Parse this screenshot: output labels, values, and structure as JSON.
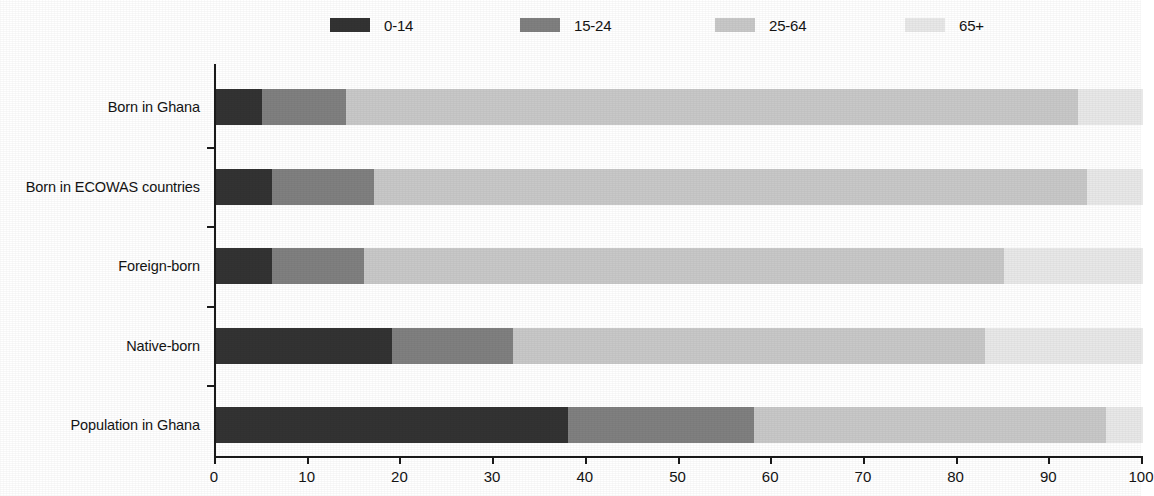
{
  "chart_data": {
    "type": "bar",
    "orientation": "horizontal",
    "stacked": true,
    "normalized_percent": true,
    "title": "",
    "subtitle": "",
    "xlabel": "",
    "ylabel": "",
    "xlim": [
      0,
      100
    ],
    "xticks": [
      0,
      10,
      20,
      30,
      40,
      50,
      60,
      70,
      80,
      90,
      100
    ],
    "xtick_labels": [
      "0",
      "10",
      "20",
      "30",
      "40",
      "50",
      "60",
      "70",
      "80",
      "90",
      "100"
    ],
    "grid": false,
    "legend_position": "top",
    "categories": [
      "Born in Ghana",
      "Born in ECOWAS countries",
      "Foreign-born",
      "Native-born",
      "Population in Ghana"
    ],
    "series": [
      {
        "name": "0-14",
        "color": "#333333",
        "values": [
          5,
          6,
          6,
          19,
          38
        ]
      },
      {
        "name": "15-24",
        "color": "#808080",
        "values": [
          9,
          11,
          10,
          13,
          20
        ]
      },
      {
        "name": "25-64",
        "color": "#c8c8c8",
        "values": [
          79,
          77,
          69,
          51,
          38
        ]
      },
      {
        "name": "65+",
        "color": "#e8e8e8",
        "values": [
          7,
          6,
          15,
          17,
          4
        ]
      }
    ],
    "cumulative_boundaries": [
      [
        5,
        14,
        93,
        100
      ],
      [
        6,
        17,
        94,
        100
      ],
      [
        6,
        16,
        85,
        100
      ],
      [
        19,
        32,
        83,
        100
      ],
      [
        38,
        58,
        96,
        100
      ]
    ]
  },
  "legend": {
    "items": [
      {
        "label": "0-14",
        "swatch_color": "#333333",
        "swatch_name": "legend-swatch-0-14"
      },
      {
        "label": "15-24",
        "swatch_color": "#808080",
        "swatch_name": "legend-swatch-15-24"
      },
      {
        "label": "25-64",
        "swatch_color": "#c8c8c8",
        "swatch_name": "legend-swatch-25-64"
      },
      {
        "label": "65+",
        "swatch_color": "#e8e8e8",
        "swatch_name": "legend-swatch-65plus"
      }
    ]
  },
  "axes": {
    "x_tick_labels": [
      "0",
      "10",
      "20",
      "30",
      "40",
      "50",
      "60",
      "70",
      "80",
      "90",
      "100"
    ],
    "y_category_labels": [
      "Born in Ghana",
      "Born in ECOWAS countries",
      "Foreign-born",
      "Native-born",
      "Population in Ghana"
    ]
  },
  "colors": {
    "axis": "#1a1a1a",
    "text": "#141414",
    "background": "#ffffff"
  }
}
